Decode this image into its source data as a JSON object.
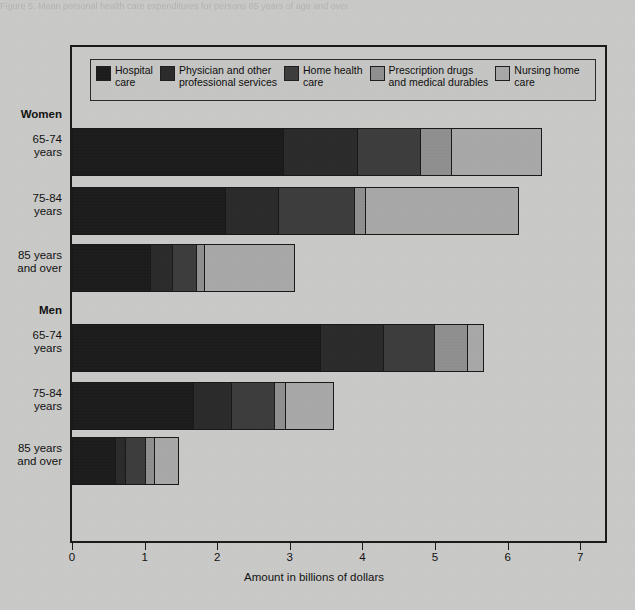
{
  "scan": {
    "top_caption": "Figure 5. Mean personal health care expenditures for persons 65 years of age and over"
  },
  "chart_data": {
    "type": "bar",
    "orientation": "horizontal",
    "stacked": true,
    "title": "",
    "xlabel": "Amount in billions of dollars",
    "ylabel": "",
    "xlim": [
      0,
      7
    ],
    "xticks": [
      "0",
      "1",
      "2",
      "3",
      "4",
      "5",
      "6",
      "7"
    ],
    "grid": false,
    "legend_position": "top-inside",
    "groups": [
      {
        "name": "Women",
        "categories": [
          "65-74\nyears",
          "75-84\nyears",
          "85 years\nand over"
        ]
      },
      {
        "name": "Men",
        "categories": [
          "65-74\nyears",
          "75-84\nyears",
          "85 years\nand over"
        ]
      }
    ],
    "categories": [
      "Women 65-74 years",
      "Women 75-84 years",
      "Women 85 years and over",
      "Men 65-74 years",
      "Men 75-84 years",
      "Men 85 years and over"
    ],
    "series": [
      {
        "name": "Hospital care",
        "color": "#1c1c1c",
        "values": [
          3.13,
          2.17,
          1.09,
          3.43,
          1.68,
          0.61
        ]
      },
      {
        "name": "Physician and other professional services",
        "color": "#2b2b2b",
        "values": [
          1.1,
          0.75,
          0.3,
          0.87,
          0.53,
          0.14
        ]
      },
      {
        "name": "Home health care",
        "color": "#3d3d3d",
        "values": [
          0.92,
          1.08,
          0.34,
          0.71,
          0.6,
          0.28
        ]
      },
      {
        "name": "Prescription drugs and medical durables",
        "color": "#8f8f8f",
        "values": [
          0.46,
          0.16,
          0.11,
          0.46,
          0.14,
          0.12
        ]
      },
      {
        "name": "Nursing home care",
        "color": "#a8a8a8",
        "values": [
          1.32,
          2.16,
          1.23,
          0.21,
          0.66,
          0.33
        ]
      }
    ],
    "totals": [
      6.93,
      6.32,
      3.07,
      5.68,
      3.61,
      1.48
    ],
    "bar_ends": [
      6.47,
      6.16,
      3.07,
      5.68,
      3.61,
      1.48
    ]
  },
  "legend": {
    "items": [
      {
        "label": "Hospital\ncare",
        "color": "#1c1c1c"
      },
      {
        "label": "Physician and other\nprofessional services",
        "color": "#2b2b2b"
      },
      {
        "label": "Home health\ncare",
        "color": "#3d3d3d"
      },
      {
        "label": "Prescription drugs\nand medical durables",
        "color": "#8f8f8f"
      },
      {
        "label": "Nursing home\ncare",
        "color": "#a8a8a8"
      }
    ]
  },
  "axis": {
    "x_title": "Amount in billions of dollars",
    "ticks": [
      "0",
      "1",
      "2",
      "3",
      "4",
      "5",
      "6",
      "7"
    ]
  },
  "ylabels": [
    {
      "text": "Women",
      "bold": true
    },
    {
      "text": "65-74\nyears",
      "bold": false
    },
    {
      "text": "75-84\nyears",
      "bold": false
    },
    {
      "text": "85 years\nand over",
      "bold": false
    },
    {
      "text": "Men",
      "bold": true
    },
    {
      "text": "65-74\nyears",
      "bold": false
    },
    {
      "text": "75-84\nyears",
      "bold": false
    },
    {
      "text": "85 years\nand over",
      "bold": false
    }
  ]
}
